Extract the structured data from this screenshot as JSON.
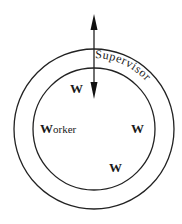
{
  "diagram": {
    "outer_ring_label": "Supervisor",
    "worker_label_initial": "W",
    "worker_label_rest": "orker",
    "workers": [
      {
        "label": "W",
        "position": "top-left"
      },
      {
        "label": "W",
        "position": "right"
      },
      {
        "label": "W",
        "position": "bottom"
      }
    ],
    "arrows": [
      {
        "direction": "up",
        "description": "outward arrow from supervisor ring"
      },
      {
        "direction": "down",
        "description": "inward arrow into worker circle"
      }
    ],
    "colors": {
      "stroke": "#222222",
      "background": "#ffffff"
    }
  }
}
